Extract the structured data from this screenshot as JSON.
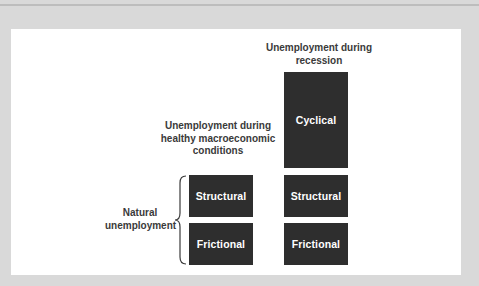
{
  "diagram": {
    "columns": [
      {
        "title": "Unemployment during healthy macroeconomic conditions",
        "title_lines": [
          "Unemployment during",
          "healthy macroeconomic",
          "conditions"
        ],
        "blocks": [
          "Structural",
          "Frictional"
        ]
      },
      {
        "title": "Unemployment during recession",
        "title_lines": [
          "Unemployment during",
          "recession"
        ],
        "blocks": [
          "Cyclical",
          "Structural",
          "Frictional"
        ]
      }
    ],
    "brace_label_lines": [
      "Natural",
      "unemployment"
    ],
    "colors": {
      "block": "#2e2e2e",
      "block_text": "#ffffff",
      "label_text": "#3a3a3a",
      "panel": "#ffffff",
      "frame": "#d9d9d9"
    }
  }
}
